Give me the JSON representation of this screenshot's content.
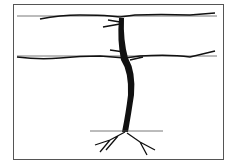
{
  "figure": {
    "elements": [
      "upper-trellis-wire",
      "lower-trellis-wire",
      "trunk",
      "cordons",
      "ground-line",
      "roots"
    ],
    "colors": {
      "ink": "#111111",
      "wire": "#555555",
      "background": "#ffffff"
    }
  }
}
